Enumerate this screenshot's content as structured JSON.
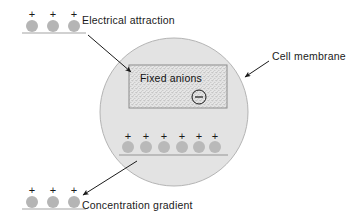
{
  "figure": {
    "title_visible": false,
    "background_color": "#ffffff",
    "cell": {
      "fill_color": "#e2e2e2",
      "stroke_color": "#b0b0b0",
      "center_x": 174,
      "center_y": 112,
      "radius": 74
    },
    "anion_box": {
      "label": "Fixed anions",
      "charge_symbol": "⊖",
      "fill_color": "#dcdcdc",
      "stroke_color": "#8a8a8a",
      "x": 129,
      "y": 65,
      "width": 98,
      "height": 43
    },
    "labels": {
      "electrical_attraction": "Electrical attraction",
      "cell_membrane": "Cell membrane",
      "concentration_gradient": "Concentration gradient"
    },
    "charge_symbol": "+",
    "ion_color": "#b5b5b5",
    "membrane_line_color": "#bdbdbd",
    "arrow_color": "#1a1a1a",
    "groups": {
      "top_outside": {
        "count": 3,
        "plus_y": 14,
        "dot_y": 26,
        "line_y": 33,
        "x_positions": [
          32,
          53,
          74
        ],
        "line_x1": 22,
        "line_x2": 86
      },
      "inside_cell": {
        "count": 6,
        "plus_y": 136,
        "dot_y": 147,
        "line_y": 155,
        "x_positions": [
          128,
          146,
          164,
          182,
          199,
          215
        ],
        "line_x1": 119,
        "line_x2": 228
      },
      "bottom_outside": {
        "count": 3,
        "plus_y": 190,
        "dot_y": 202,
        "line_y": 209,
        "x_positions": [
          32,
          53,
          74
        ],
        "line_x1": 22,
        "line_x2": 86
      }
    },
    "arrows": [
      {
        "name": "electrical-attraction-arrow",
        "x1": 88,
        "y1": 35,
        "x2": 133,
        "y2": 73
      },
      {
        "name": "cell-membrane-arrow",
        "x1": 269,
        "y1": 61,
        "x2": 243,
        "y2": 78
      },
      {
        "name": "concentration-gradient-arrow",
        "x1": 137,
        "y1": 161,
        "x2": 81,
        "y2": 196
      }
    ]
  }
}
